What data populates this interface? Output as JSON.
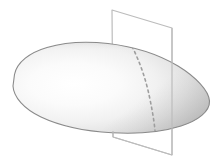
{
  "figure": {
    "title": "Solid body intersected by a cutting plane",
    "canvas": {
      "width": 222,
      "height": 161,
      "background": "#ffffff"
    },
    "solid": {
      "name": "blob-solid",
      "description": "Smooth convex ovoid / teardrop solid, pointed at the left, rounded at the right",
      "outline_path": "M 14.5 74.5 C 17 62 30 52.5 47 47.5 C 66 41.8 88 41.2 108 43.5 C 133 46.4 158 54 178 66 C 196 77 209 91 209.5 101 C 210 111.5 198 120.5 181 126 C 160 132.6 136 134.2 112 132.8 C 86 131.3 60 126 41 117 C 24 109 13.5 97 13 86 Z",
      "fill_light": "#fdfdfd",
      "fill_mid": "#e3e3e3",
      "fill_dark": "#b4b4b4",
      "outline_color": "#8a8a8a",
      "outline_width": 1.1,
      "highlight_center": {
        "x": 70,
        "y": 82
      }
    },
    "cutting_plane": {
      "name": "cutting-plane",
      "description": "Vertical quadrilateral (plane) slicing through the solid",
      "corners": [
        {
          "label": "top-left",
          "x": 112,
          "y": 10
        },
        {
          "label": "top-right",
          "x": 172,
          "y": 28
        },
        {
          "label": "bottom-right",
          "x": 172,
          "y": 155
        },
        {
          "label": "bottom-left",
          "x": 113,
          "y": 137
        }
      ],
      "edge_color": "#bcbcbc",
      "edge_width": 1.2,
      "fill": "rgba(255,255,255,0.0)"
    },
    "intersection_curve": {
      "name": "intersection-curve",
      "description": "Dashed curve where the cutting plane meets the solid surface",
      "path": "M 132 46.5 C 140 62 146 80 149.5 97 C 152 109 154 120 155 130.5",
      "stroke": "#9e9e9e",
      "stroke_width": 1.6,
      "dash_pattern": "2.4 3.4"
    },
    "labels": []
  }
}
